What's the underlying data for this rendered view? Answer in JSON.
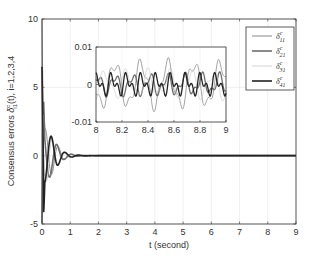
{
  "chart_data": {
    "type": "line",
    "title": "",
    "xlabel": "t (second)",
    "ylabel": "Consensus errors δ^c_i1(t), i=1,2,3,4",
    "xlim": [
      0,
      9
    ],
    "ylim": [
      -5,
      10
    ],
    "x_ticks": [
      "0",
      "1",
      "2",
      "3",
      "4",
      "5",
      "6",
      "7",
      "8",
      "9"
    ],
    "y_ticks": [
      "-5",
      "0",
      "5",
      "10"
    ],
    "grid": true,
    "legend_position": "upper right",
    "series": [
      {
        "name": "δ^c_11",
        "color": "#8a8a8a",
        "width": 1.0,
        "description": "damped oscillation, spike to ~10 near t=0, settles to 0 by ~t=1.5"
      },
      {
        "name": "δ^c_21",
        "color": "#6e6e6e",
        "width": 1.6,
        "description": "damped oscillation, dips to ~-5 near t=0, settles to 0"
      },
      {
        "name": "δ^c_31",
        "color": "#c8c8c8",
        "width": 0.8,
        "description": "damped oscillation, settles to 0"
      },
      {
        "name": "δ^c_41",
        "color": "#222222",
        "width": 1.6,
        "description": "damped oscillation, settles to 0"
      }
    ],
    "transient": {
      "t": [
        0,
        0.05,
        0.1,
        0.2,
        0.3,
        0.4,
        0.5,
        0.6,
        0.7,
        0.8,
        1.0,
        1.2,
        1.5,
        2.0,
        9.0
      ],
      "envelope": [
        10,
        5,
        2.0,
        1.8,
        1.5,
        1.2,
        0.9,
        0.6,
        0.4,
        0.25,
        0.12,
        0.06,
        0.02,
        0.0,
        0.0
      ]
    },
    "inset": {
      "xlim": [
        8,
        9
      ],
      "ylim": [
        -0.01,
        0.01
      ],
      "x_ticks": [
        "8",
        "8.2",
        "8.4",
        "8.6",
        "8.8",
        "9"
      ],
      "y_ticks": [
        "-0.01",
        "0",
        "0.01"
      ],
      "description": "steady-state residual oscillations within ±0.007"
    }
  },
  "legend": {
    "items": [
      {
        "label": "δ",
        "sup": "c",
        "sub": "11"
      },
      {
        "label": "δ",
        "sup": "c",
        "sub": "21"
      },
      {
        "label": "δ",
        "sup": "c",
        "sub": "31"
      },
      {
        "label": "δ",
        "sup": "c",
        "sub": "41"
      }
    ]
  },
  "axes": {
    "xlabel": "t (second)",
    "ylabel_prefix": "Consensus errors ",
    "ylabel_sym": "δ",
    "ylabel_sup": "c",
    "ylabel_sub": "i1",
    "ylabel_suffix": "(t), i=1,2,3,4"
  }
}
